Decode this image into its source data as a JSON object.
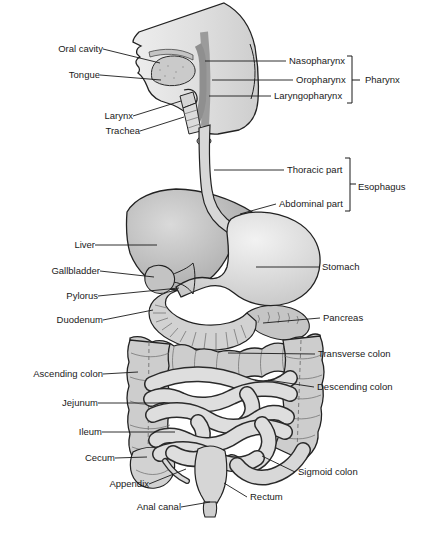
{
  "labels": {
    "oral_cavity": "Oral cavity",
    "tongue": "Tongue",
    "larynx": "Larynx",
    "trachea": "Trachea",
    "nasopharynx": "Nasopharynx",
    "oropharynx": "Oropharynx",
    "laryngopharynx": "Laryngopharynx",
    "pharynx": "Pharynx",
    "thoracic_part": "Thoracic part",
    "abdominal_part": "Abdominal part",
    "esophagus": "Esophagus",
    "liver": "Liver",
    "gallbladder": "Gallbladder",
    "stomach": "Stomach",
    "pylorus": "Pylorus",
    "duodenum": "Duodenum",
    "pancreas": "Pancreas",
    "transverse_colon": "Transverse colon",
    "ascending_colon": "Ascending colon",
    "descending_colon": "Descending colon",
    "jejunum": "Jejunum",
    "ileum": "Ileum",
    "cecum": "Cecum",
    "appendix": "Appendix",
    "sigmoid_colon": "Sigmoid colon",
    "rectum": "Rectum",
    "anal_canal": "Anal canal"
  },
  "brackets": [
    {
      "label": "Pharynx",
      "items": [
        "Nasopharynx",
        "Oropharynx",
        "Laryngopharynx"
      ]
    },
    {
      "label": "Esophagus",
      "items": [
        "Thoracic part",
        "Abdominal part"
      ]
    }
  ],
  "colors": {
    "background": "#ffffff",
    "outline": "#222222",
    "organ_light": "#e6e6e6",
    "organ_mid": "#cfcfcf",
    "organ_dark": "#b0b0b0",
    "label_text": "#1a1a1a"
  }
}
